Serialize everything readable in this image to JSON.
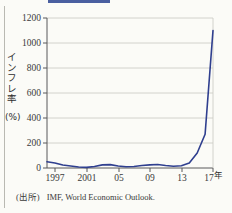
{
  "figure": {
    "background_color": "#fbfbf7",
    "accent_bar_color": "#4a5fa0",
    "line_color": "#2f3f8f",
    "grid_color": "#c9c9c2",
    "axis_color": "#58585a"
  },
  "y_axis": {
    "title_chars": [
      "イ",
      "ン",
      "フ",
      "レ",
      "率"
    ],
    "unit_label": "(%)",
    "ticks": [
      "0",
      "200",
      "400",
      "600",
      "800",
      "1000",
      "1200"
    ]
  },
  "x_axis": {
    "ticks": [
      "1997",
      "2001",
      "05",
      "09",
      "13",
      "17"
    ],
    "unit_suffix": "年"
  },
  "source": {
    "label": "(出所)",
    "text": "IMF, World Economic Outlook."
  },
  "chart_data": {
    "type": "line",
    "title": "",
    "xlabel": "年",
    "ylabel": "インフレ率（%）",
    "xlim": [
      1996,
      2017
    ],
    "ylim": [
      0,
      1200
    ],
    "grid": true,
    "legend": "none",
    "x": [
      1996,
      1997,
      1998,
      1999,
      2000,
      2001,
      2002,
      2003,
      2004,
      2005,
      2006,
      2007,
      2008,
      2009,
      2010,
      2011,
      2012,
      2013,
      2014,
      2015,
      2016,
      2017
    ],
    "series": [
      {
        "name": "インフレ率",
        "values": [
          50,
          40,
          24,
          16,
          8,
          5,
          12,
          25,
          27,
          16,
          10,
          12,
          20,
          25,
          28,
          20,
          14,
          18,
          40,
          120,
          270,
          1100
        ]
      }
    ],
    "x_tick_labels": [
      "1997",
      "2001",
      "05",
      "09",
      "13",
      "17"
    ],
    "x_tick_values": [
      1997,
      2001,
      2005,
      2009,
      2013,
      2017
    ],
    "y_tick_values": [
      0,
      200,
      400,
      600,
      800,
      1000,
      1200
    ]
  }
}
